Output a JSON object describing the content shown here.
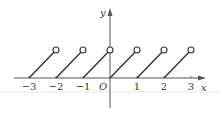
{
  "chart_data": {
    "type": "line",
    "title": "",
    "xlabel": "x",
    "ylabel": "y",
    "origin_label": "O",
    "xlim": [
      -3.5,
      4
    ],
    "ylim": [
      -1,
      2
    ],
    "grid": false,
    "x_ticks": [
      -3,
      -2,
      -1,
      1,
      2,
      3
    ],
    "x_tick_labels": [
      "-3",
      "-2",
      "-1",
      "1",
      "2",
      "3"
    ],
    "segments": [
      {
        "start": [
          -3,
          0
        ],
        "end": [
          -2,
          1
        ],
        "end_open": true
      },
      {
        "start": [
          -2,
          0
        ],
        "end": [
          -1,
          1
        ],
        "end_open": true
      },
      {
        "start": [
          -1,
          0
        ],
        "end": [
          0,
          1
        ],
        "end_open": true
      },
      {
        "start": [
          0,
          0
        ],
        "end": [
          1,
          1
        ],
        "end_open": true
      },
      {
        "start": [
          1,
          0
        ],
        "end": [
          2,
          1
        ],
        "end_open": true
      },
      {
        "start": [
          2,
          0
        ],
        "end": [
          3,
          1
        ],
        "end_open": true
      }
    ]
  },
  "colors": {
    "line": "#333333",
    "axis": "#555555",
    "background": "#ffffff"
  }
}
